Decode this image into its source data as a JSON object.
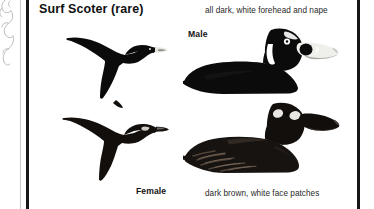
{
  "page": {
    "type": "field-guide-plate",
    "background_color": "#ffffff",
    "border_color": "#161616",
    "hairline_color": "#c9c9c9"
  },
  "plate": {
    "title": "Surf Scoter (rare)",
    "species": "Surf Scoter",
    "status_note": "(rare)"
  },
  "figures": [
    {
      "id": "flying-male",
      "sex_label": "",
      "pose": "flying",
      "description": "all dark silhouette in flight, wings raised, pale bill",
      "color": "#0d0d0d"
    },
    {
      "id": "swimming-male",
      "sex_label": "Male",
      "pose": "swimming",
      "caption": "all dark, white forehead and nape",
      "color": "#0d0d0d",
      "marking_color": "#ffffff"
    },
    {
      "id": "flying-female",
      "sex_label": "",
      "pose": "flying",
      "description": "dark brown silhouette in flight, pale face patch",
      "color": "#1a1410"
    },
    {
      "id": "swimming-female",
      "sex_label": "Female",
      "pose": "swimming",
      "caption": "dark brown, white face patches",
      "color": "#1e1813",
      "marking_color": "#efefef"
    }
  ],
  "captions": {
    "male_note": "all dark, white forehead and nape",
    "female_note": "dark brown, white face patches"
  },
  "labels": {
    "male": "Male",
    "female": "Female"
  }
}
